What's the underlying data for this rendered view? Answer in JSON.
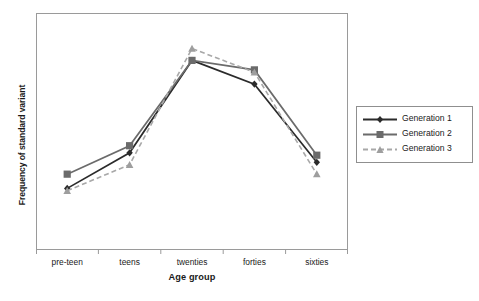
{
  "chart_data": {
    "type": "line",
    "title": "",
    "xlabel": "Age group",
    "ylabel": "Frequency of standard variant",
    "categories": [
      "pre-teen",
      "teens",
      "twenties",
      "forties",
      "sixties"
    ],
    "series": [
      {
        "name": "Generation 1",
        "marker": "diamond",
        "line_style": "solid",
        "color": "#2b2b2b",
        "values": [
          0.26,
          0.41,
          0.8,
          0.7,
          0.37
        ]
      },
      {
        "name": "Generation 2",
        "marker": "square",
        "line_style": "solid",
        "color": "#6b6b6b",
        "values": [
          0.32,
          0.44,
          0.8,
          0.76,
          0.4
        ]
      },
      {
        "name": "Generation 3",
        "marker": "triangle",
        "line_style": "dashed",
        "color": "#a8a8a8",
        "values": [
          0.25,
          0.36,
          0.85,
          0.75,
          0.32
        ]
      }
    ],
    "ylim": [
      0,
      1
    ],
    "y_ticks_shown": false,
    "x_tick_marks": 4,
    "grid": false,
    "legend_position": "right",
    "legend_entries": [
      "Generation 1",
      "Generation 2",
      "Generation 3"
    ]
  },
  "axes": {
    "y_title": "Frequency of standard variant",
    "x_title": "Age group",
    "x_tick_labels": [
      "pre-teen",
      "teens",
      "twenties",
      "forties",
      "sixties"
    ]
  },
  "legend": {
    "items": [
      {
        "label": "Generation 1",
        "marker": "diamond-marker",
        "style": "solid",
        "color": "#2b2b2b"
      },
      {
        "label": "Generation 2",
        "marker": "square-marker",
        "style": "solid",
        "color": "#6b6b6b"
      },
      {
        "label": "Generation 3",
        "marker": "triangle-marker",
        "style": "dashed",
        "color": "#a8a8a8"
      }
    ]
  },
  "colors": {
    "generation_1": "#2b2b2b",
    "generation_2": "#6b6b6b",
    "generation_3": "#a8a8a8",
    "frame": "#9a9a9a",
    "background": "#ffffff",
    "text": "#1a1a1a"
  }
}
